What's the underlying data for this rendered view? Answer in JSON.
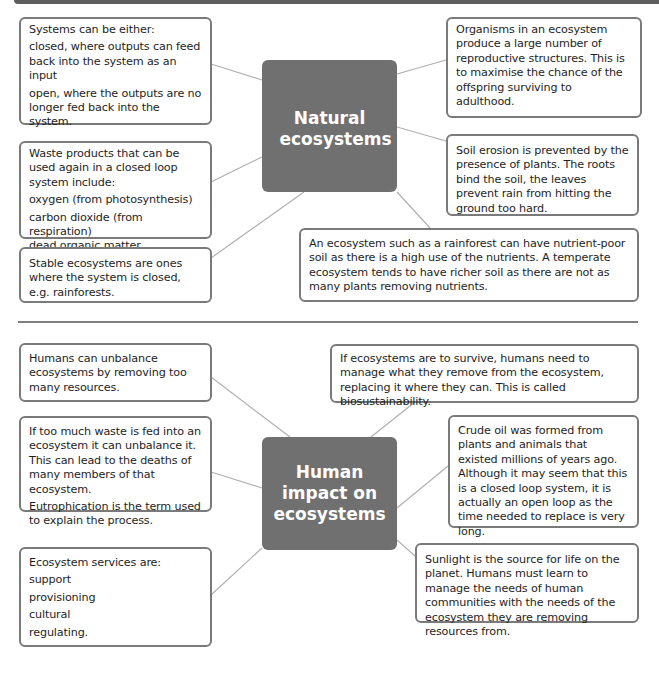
{
  "sections": {
    "natural": {
      "hub_title": "Natural ecosystems",
      "boxes": {
        "systems": {
          "intro": "Systems can be either:",
          "items": [
            "closed, where outputs can feed back into the system as an input",
            "open, where the outputs are no longer fed back into the system."
          ]
        },
        "waste": {
          "intro": "Waste products that can be used again in a closed loop system include:",
          "items": [
            "oxygen (from photosynthesis)",
            "carbon dioxide (from respiration)",
            "dead organic matter."
          ]
        },
        "stable": {
          "text": "Stable ecosystems are ones where the system is closed, e.g. rainforests."
        },
        "organisms": {
          "text": "Organisms in an ecosystem produce a large number of reproductive structures. This is to maximise the chance of the offspring surviving to adulthood."
        },
        "soil_erosion": {
          "text": "Soil erosion is prevented by the presence of plants. The roots bind the soil, the leaves prevent rain from hitting the ground too hard."
        },
        "rainforest_soil": {
          "text": "An ecosystem such as a rainforest can have nutrient-poor soil as there is a high use of the nutrients. A temperate ecosystem tends to have richer soil as there are not as many plants removing nutrients."
        }
      }
    },
    "human": {
      "hub_title": "Human impact on ecosystems",
      "boxes": {
        "unbalance": {
          "text": "Humans can unbalance ecosystems by removing too many resources."
        },
        "too_much_waste": {
          "text": "If too much waste is fed into an ecosystem it can unbalance it. This can lead to the deaths of many members of that ecosystem.",
          "note": "Eutrophication is the term used to explain the process."
        },
        "services": {
          "intro": "Ecosystem services are:",
          "items": [
            "support",
            "provisioning",
            "cultural",
            "regulating."
          ]
        },
        "biosustainability": {
          "text": "If ecosystems are to survive, humans need to manage what they remove from the ecosystem, replacing it where they can. This is called biosustainability."
        },
        "crude_oil": {
          "text": "Crude oil was formed from plants and animals that existed millions of years ago. Although it may seem that this is a closed loop system, it is actually an open loop as the time needed to replace is very long."
        },
        "sunlight": {
          "text": "Sunlight is the source for life on the planet. Humans must learn to manage the needs of human communities with the needs of the ecosystem they are removing resources from."
        }
      }
    }
  },
  "colors": {
    "hub_fill": "#707070",
    "box_border": "#7a7a7a",
    "connector": "#b0b0b0",
    "divider": "#7e7e7e",
    "top_bar": "#5e5e5e"
  }
}
